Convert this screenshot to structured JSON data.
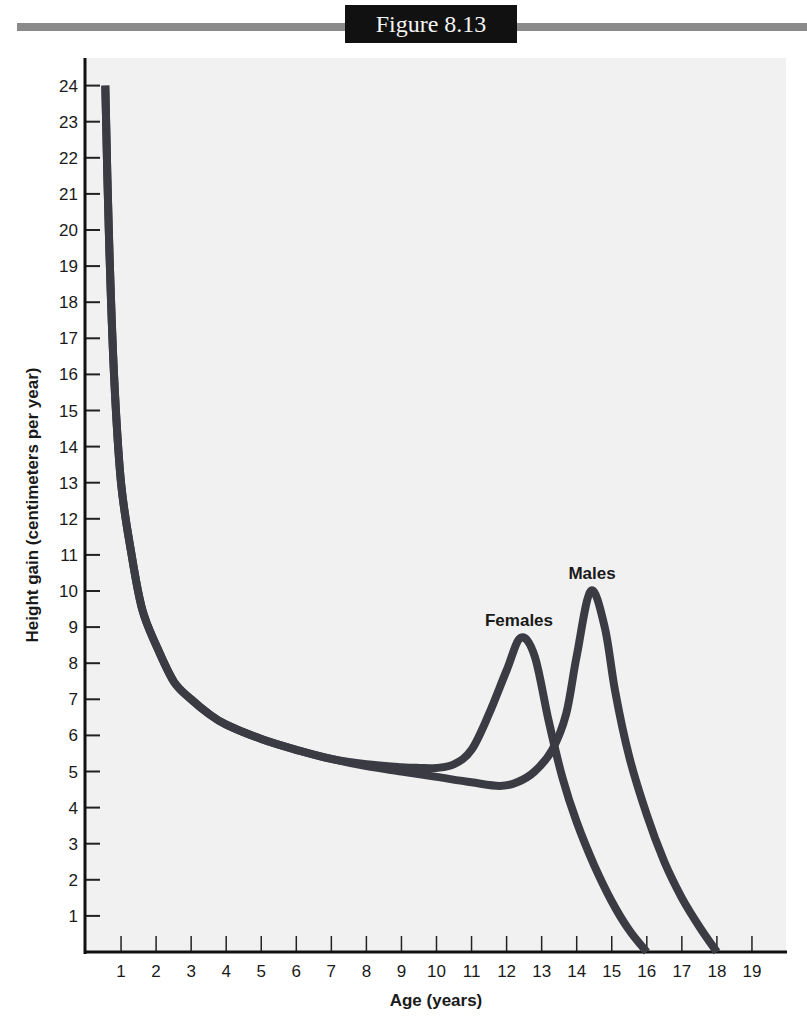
{
  "figure": {
    "title": "Figure 8.13",
    "header_bar_color": "#8a8a8a",
    "title_box_color": "#111111",
    "plot_background": "#f1f1f1",
    "line_color": "#3b3b44"
  },
  "chart_data": {
    "type": "line",
    "title": "Figure 8.13",
    "xlabel": "Age (years)",
    "ylabel": "Height gain (centimeters per year)",
    "xlim": [
      0,
      20
    ],
    "ylim": [
      0,
      24
    ],
    "x_ticks": [
      1,
      2,
      3,
      4,
      5,
      6,
      7,
      8,
      9,
      10,
      11,
      12,
      13,
      14,
      15,
      16,
      17,
      18,
      19
    ],
    "y_ticks": [
      1,
      2,
      3,
      4,
      5,
      6,
      7,
      8,
      9,
      10,
      11,
      12,
      13,
      14,
      15,
      16,
      17,
      18,
      19,
      20,
      21,
      22,
      23,
      24
    ],
    "grid": false,
    "legend": "inline labels at peaks",
    "series": [
      {
        "name": "Females",
        "label_position": {
          "age": 12.0,
          "value": 8.9
        },
        "x": [
          0.55,
          0.65,
          0.8,
          1.0,
          1.3,
          1.6,
          2.0,
          2.5,
          3.0,
          3.5,
          4.0,
          5.0,
          6.0,
          7.0,
          8.0,
          9.0,
          9.5,
          10.0,
          10.5,
          11.0,
          11.5,
          12.0,
          12.4,
          12.8,
          13.2,
          13.6,
          14.0,
          14.5,
          15.0,
          15.5,
          16.0
        ],
        "values": [
          24,
          20,
          16,
          13,
          11,
          9.5,
          8.5,
          7.5,
          7.0,
          6.6,
          6.3,
          5.9,
          5.6,
          5.35,
          5.2,
          5.12,
          5.1,
          5.1,
          5.2,
          5.6,
          6.6,
          7.8,
          8.7,
          8.2,
          6.4,
          4.8,
          3.6,
          2.4,
          1.4,
          0.6,
          0
        ]
      },
      {
        "name": "Males",
        "label_position": {
          "age": 14.4,
          "value": 10.3
        },
        "x": [
          0.55,
          0.65,
          0.8,
          1.0,
          1.3,
          1.6,
          2.0,
          2.5,
          3.0,
          3.5,
          4.0,
          5.0,
          6.0,
          7.0,
          8.0,
          9.0,
          10.0,
          11.0,
          11.8,
          12.3,
          12.8,
          13.3,
          13.7,
          14.0,
          14.4,
          14.8,
          15.1,
          15.5,
          16.0,
          16.5,
          17.0,
          17.5,
          18.0
        ],
        "values": [
          24,
          20,
          16,
          13,
          11,
          9.5,
          8.5,
          7.5,
          7.0,
          6.6,
          6.3,
          5.9,
          5.6,
          5.35,
          5.15,
          5.0,
          4.85,
          4.7,
          4.6,
          4.7,
          5.0,
          5.6,
          6.6,
          8.2,
          10.0,
          9.0,
          7.2,
          5.4,
          3.8,
          2.5,
          1.5,
          0.7,
          0
        ]
      }
    ]
  }
}
